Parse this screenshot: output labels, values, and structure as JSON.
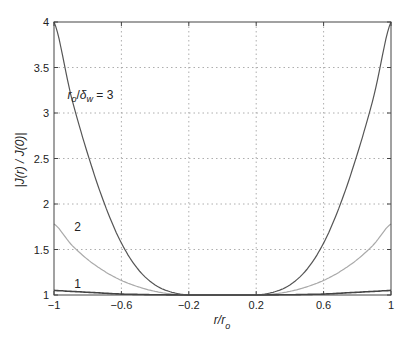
{
  "chart_data": {
    "type": "line",
    "title": "",
    "xlabel": "r/r_o",
    "ylabel": "|J(r) / J(0)|",
    "xlim": [
      -1,
      1
    ],
    "ylim": [
      1,
      4
    ],
    "grid": true,
    "x_ticks": [
      "-1",
      "-0.6",
      "-0.2",
      "0.2",
      "0.6",
      "1"
    ],
    "y_ticks": [
      "1",
      "1.5",
      "2",
      "2.5",
      "3",
      "3.5",
      "4"
    ],
    "x": [
      -1,
      -0.9,
      -0.8,
      -0.7,
      -0.6,
      -0.5,
      -0.4,
      -0.3,
      -0.2,
      -0.1,
      0,
      0.1,
      0.2,
      0.3,
      0.4,
      0.5,
      0.6,
      0.7,
      0.8,
      0.9,
      1
    ],
    "series": [
      {
        "name": "r_o/δ_w = 3",
        "label": "r_o/δ_w = 3",
        "color": "#555555",
        "values": [
          4.0,
          3.2,
          2.55,
          2.0,
          1.57,
          1.28,
          1.11,
          1.03,
          1.0,
          1.0,
          1.0,
          1.0,
          1.0,
          1.03,
          1.11,
          1.28,
          1.57,
          2.0,
          2.55,
          3.2,
          4.0
        ]
      },
      {
        "name": "2",
        "label": "2",
        "color": "#aaaaaa",
        "values": [
          1.78,
          1.56,
          1.39,
          1.26,
          1.16,
          1.09,
          1.04,
          1.01,
          1.0,
          1.0,
          1.0,
          1.0,
          1.0,
          1.01,
          1.04,
          1.09,
          1.16,
          1.26,
          1.39,
          1.56,
          1.78
        ]
      },
      {
        "name": "1",
        "label": "1",
        "color": "#444444",
        "values": [
          1.05,
          1.04,
          1.03,
          1.02,
          1.01,
          1.006,
          1.003,
          1.001,
          1.0,
          1.0,
          1.0,
          1.0,
          1.0,
          1.001,
          1.003,
          1.006,
          1.01,
          1.02,
          1.03,
          1.04,
          1.05
        ]
      }
    ],
    "annotations": [
      {
        "text": "r_o/δ_w = 3",
        "x": -0.92,
        "y": 3.2
      },
      {
        "text": "2",
        "x": -0.88,
        "y": 1.75
      },
      {
        "text": "1",
        "x": -0.88,
        "y": 1.12
      }
    ]
  }
}
